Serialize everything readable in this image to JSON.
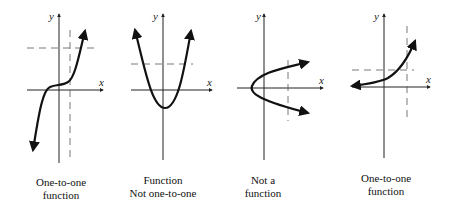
{
  "graphs": [
    {
      "id": "cubic",
      "caption_line1": "One-to-one",
      "caption_line2": "function",
      "x_label": "x",
      "y_label": "y",
      "test": "horizontal and vertical line tests passed"
    },
    {
      "id": "parabola",
      "caption_line1": "Function",
      "caption_line2": "Not one-to-one",
      "x_label": "x",
      "y_label": "y",
      "test": "horizontal line test failed"
    },
    {
      "id": "sideways-parabola",
      "caption_line1": "Not a",
      "caption_line2": "function",
      "x_label": "x",
      "y_label": "y",
      "test": "vertical line test failed"
    },
    {
      "id": "exponential",
      "caption_line1": "One-to-one",
      "caption_line2": "function",
      "x_label": "x",
      "y_label": "y",
      "test": "horizontal and vertical line tests passed"
    }
  ],
  "colors": {
    "curve": "#111111",
    "axis": "#222222",
    "dashed": "#555555"
  }
}
